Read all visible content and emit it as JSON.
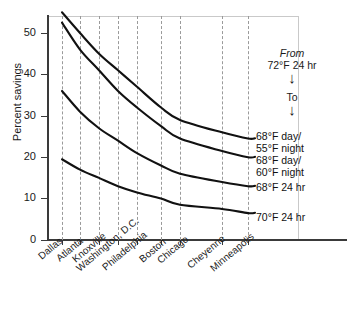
{
  "chart_data": {
    "type": "line",
    "title": "",
    "xlabel": "",
    "ylabel": "Percent savings",
    "ylim": [
      0,
      55
    ],
    "yticks": [
      0,
      10,
      20,
      30,
      40,
      50
    ],
    "grid": "vertical-dashed",
    "legend_position": "right-of-curve-ends",
    "categories": [
      "Dallas",
      "Atlanta",
      "Knoxville",
      "Washington, D.C.",
      "Philadelphia",
      "Boston",
      "Chicago",
      "Cheyenne",
      "Minneapolis"
    ],
    "series": [
      {
        "name": "68°F day/55°F night",
        "label_line1": "68°F day/",
        "label_line2": "55°F night",
        "values": [
          55,
          50,
          45,
          41,
          37,
          32,
          29,
          26,
          24.5
        ]
      },
      {
        "name": "68°F day/60°F night",
        "label_line1": "68°F day/",
        "label_line2": "60°F night",
        "values": [
          52.5,
          46,
          41,
          36,
          32,
          27.5,
          24.5,
          21.5,
          20
        ]
      },
      {
        "name": "68°F 24 hr",
        "label_line1": "68°F 24 hr",
        "label_line2": "",
        "values": [
          36,
          31,
          27,
          24,
          21,
          18,
          16,
          14,
          13
        ]
      },
      {
        "name": "70°F 24 hr",
        "label_line1": "70°F 24 hr",
        "label_line2": "",
        "values": [
          19.5,
          17,
          15,
          13,
          11.5,
          10,
          8.5,
          7.5,
          6.5
        ]
      }
    ],
    "annotation": {
      "from_label": "From",
      "from_value": "72°F 24 hr",
      "to_label": "To",
      "arrow_glyph": "↓"
    },
    "colors": {
      "curve": "#111111",
      "axis": "#3a3a3a",
      "gridline": "#9a9a9a",
      "frame": "#c9c9c9",
      "background": "#ffffff",
      "text": "#1a1a1a"
    }
  }
}
